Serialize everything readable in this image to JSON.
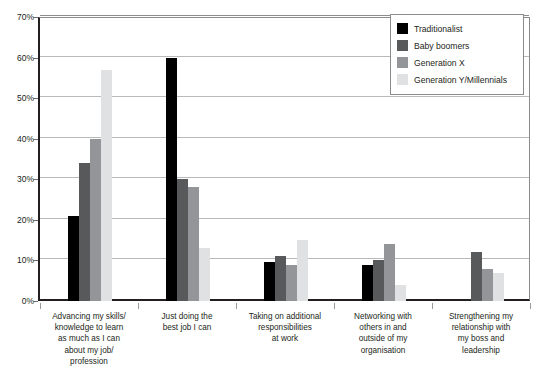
{
  "chart_data": {
    "type": "bar",
    "title": "",
    "subtitle": "",
    "xlabel": "",
    "ylabel": "",
    "ylim": [
      0,
      70
    ],
    "ytick_labels": [
      "0%",
      "10%",
      "20%",
      "30%",
      "40%",
      "50%",
      "60%",
      "70%"
    ],
    "ytick_values": [
      0,
      10,
      20,
      30,
      40,
      50,
      60,
      70
    ],
    "grid": true,
    "legend_position": "top-right",
    "value_suffix": "%",
    "categories": [
      "Advancing my skills/ knowledge to learn as much as I can about my job/ profession",
      "Just doing the best job I can",
      "Taking on additional responsibilities at work",
      "Networking with others in and outside of my organisation",
      "Strengthening my relationship with my boss and leadership"
    ],
    "category_lines": [
      [
        "Advancing my skills/",
        "knowledge to learn",
        "as much as I can",
        "about my job/",
        "profession"
      ],
      [
        "Just doing the",
        "best job I can"
      ],
      [
        "Taking on additional",
        "responsibilities",
        "at work"
      ],
      [
        "Networking with",
        "others in and",
        "outside of my",
        "organisation"
      ],
      [
        "Strengthening my",
        "relationship with",
        "my boss and",
        "leadership"
      ]
    ],
    "series": [
      {
        "name": "Traditionalist",
        "color": "#000000",
        "values": [
          21,
          60,
          9.5,
          9,
          0
        ]
      },
      {
        "name": "Baby boomers",
        "color": "#58595b",
        "values": [
          34,
          30,
          11,
          10,
          12
        ]
      },
      {
        "name": "Generation X",
        "color": "#939598",
        "values": [
          40,
          28,
          9,
          14,
          8
        ]
      },
      {
        "name": "Generation Y/Millennials",
        "color": "#e0e1e2",
        "values": [
          57,
          13,
          15,
          4,
          7
        ]
      }
    ]
  },
  "legend": {
    "items": [
      {
        "label": "Traditionalist",
        "color": "#000000"
      },
      {
        "label": "Baby boomers",
        "color": "#58595b"
      },
      {
        "label": "Generation X",
        "color": "#939598"
      },
      {
        "label": "Generation Y/Millennials",
        "color": "#e0e1e2"
      }
    ]
  }
}
